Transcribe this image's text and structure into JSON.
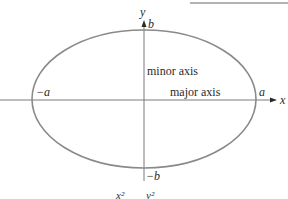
{
  "figure": {
    "type": "ellipse-diagram",
    "colors": {
      "ellipse": "#8a8a8a",
      "axes": "#7a7a7a",
      "text": "#2a2a2a",
      "top_rule": "#9a9a9a"
    },
    "axis_labels": {
      "x": "x",
      "y": "y"
    },
    "vertex_labels": {
      "pos_a": "a",
      "neg_a": "−a",
      "pos_b": "b",
      "neg_b": "−b"
    },
    "axis_names": {
      "major": "major axis",
      "minor": "minor axis"
    },
    "equation_fragment": {
      "x_term": "x²",
      "y_term": "y²"
    }
  }
}
